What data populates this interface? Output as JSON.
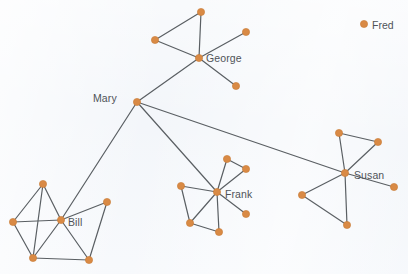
{
  "figure": {
    "type": "node-link-network-diagram",
    "background_color": "#f3f6fa",
    "node_color": "#d98a45",
    "node_stroke_color": "#c87a34",
    "edge_color": "#5a5f63",
    "label_color": "#4f5358",
    "node_radius": 3.6,
    "edge_width": 1.2,
    "width": 408,
    "height": 274
  },
  "chart_data": {
    "type": "network",
    "title": "",
    "node_count": 26,
    "edge_count": 33,
    "labeled_nodes": [
      "Mary",
      "George",
      "Bill",
      "Frank",
      "Susan",
      "Fred"
    ],
    "clusters": [
      {
        "name": "George",
        "hub": "george",
        "members": 4
      },
      {
        "name": "Bill",
        "hub": "bill",
        "members": 5
      },
      {
        "name": "Frank",
        "hub": "frank",
        "members": 6
      },
      {
        "name": "Susan",
        "hub": "susan",
        "members": 6
      },
      {
        "name": "Mary",
        "hub": "mary",
        "members": 1
      },
      {
        "name": "Fred",
        "hub": "fred",
        "members": 1
      }
    ],
    "nodes": [
      {
        "id": "mary",
        "x": 137,
        "y": 102,
        "label": "Mary",
        "label_dx": -30,
        "label_dy": -4,
        "labeled": true
      },
      {
        "id": "george",
        "x": 199,
        "y": 58,
        "label": "George",
        "label_dx": 7,
        "label_dy": 0,
        "labeled": true
      },
      {
        "id": "g1",
        "x": 201,
        "y": 12,
        "label": "",
        "labeled": false
      },
      {
        "id": "g2",
        "x": 155,
        "y": 40,
        "label": "",
        "labeled": false
      },
      {
        "id": "g3",
        "x": 246,
        "y": 32,
        "label": "",
        "labeled": false
      },
      {
        "id": "g4",
        "x": 236,
        "y": 86,
        "label": "",
        "labeled": false
      },
      {
        "id": "bill",
        "x": 61,
        "y": 220,
        "label": "Bill",
        "label_dx": 7,
        "label_dy": 2,
        "labeled": true
      },
      {
        "id": "b1",
        "x": 43,
        "y": 184,
        "label": "",
        "labeled": false
      },
      {
        "id": "b2",
        "x": 13,
        "y": 222,
        "label": "",
        "labeled": false
      },
      {
        "id": "b3",
        "x": 33,
        "y": 258,
        "label": "",
        "labeled": false
      },
      {
        "id": "b4",
        "x": 89,
        "y": 260,
        "label": "",
        "labeled": false
      },
      {
        "id": "b5",
        "x": 107,
        "y": 202,
        "label": "",
        "labeled": false
      },
      {
        "id": "frank",
        "x": 217,
        "y": 192,
        "label": "Frank",
        "label_dx": 8,
        "label_dy": 2,
        "labeled": true
      },
      {
        "id": "f1",
        "x": 227,
        "y": 159,
        "label": "",
        "labeled": false
      },
      {
        "id": "f2",
        "x": 246,
        "y": 169,
        "label": "",
        "labeled": false
      },
      {
        "id": "f3",
        "x": 181,
        "y": 186,
        "label": "",
        "labeled": false
      },
      {
        "id": "f4",
        "x": 190,
        "y": 223,
        "label": "",
        "labeled": false
      },
      {
        "id": "f5",
        "x": 219,
        "y": 232,
        "label": "",
        "labeled": false
      },
      {
        "id": "f6",
        "x": 246,
        "y": 214,
        "label": "",
        "labeled": false
      },
      {
        "id": "susan",
        "x": 345,
        "y": 173,
        "label": "Susan",
        "label_dx": 9,
        "label_dy": 2,
        "labeled": true
      },
      {
        "id": "s1",
        "x": 339,
        "y": 133,
        "label": "",
        "labeled": false
      },
      {
        "id": "s2",
        "x": 378,
        "y": 142,
        "label": "",
        "labeled": false
      },
      {
        "id": "s3",
        "x": 302,
        "y": 195,
        "label": "",
        "labeled": false
      },
      {
        "id": "s4",
        "x": 347,
        "y": 225,
        "label": "",
        "labeled": false
      },
      {
        "id": "s5",
        "x": 394,
        "y": 187,
        "label": "",
        "labeled": false
      },
      {
        "id": "fred",
        "x": 364,
        "y": 24,
        "label": "Fred",
        "label_dx": 8,
        "label_dy": 1,
        "labeled": true
      }
    ],
    "edges": [
      {
        "source": "mary",
        "target": "george"
      },
      {
        "source": "mary",
        "target": "bill"
      },
      {
        "source": "mary",
        "target": "frank"
      },
      {
        "source": "mary",
        "target": "susan"
      },
      {
        "source": "george",
        "target": "g1"
      },
      {
        "source": "george",
        "target": "g2"
      },
      {
        "source": "george",
        "target": "g3"
      },
      {
        "source": "george",
        "target": "g4"
      },
      {
        "source": "g1",
        "target": "g2"
      },
      {
        "source": "bill",
        "target": "b1"
      },
      {
        "source": "bill",
        "target": "b2"
      },
      {
        "source": "bill",
        "target": "b3"
      },
      {
        "source": "bill",
        "target": "b4"
      },
      {
        "source": "bill",
        "target": "b5"
      },
      {
        "source": "b1",
        "target": "b2"
      },
      {
        "source": "b1",
        "target": "b3"
      },
      {
        "source": "b2",
        "target": "b3"
      },
      {
        "source": "b3",
        "target": "b4"
      },
      {
        "source": "b4",
        "target": "b5"
      },
      {
        "source": "frank",
        "target": "f1"
      },
      {
        "source": "frank",
        "target": "f2"
      },
      {
        "source": "frank",
        "target": "f3"
      },
      {
        "source": "frank",
        "target": "f4"
      },
      {
        "source": "frank",
        "target": "f5"
      },
      {
        "source": "frank",
        "target": "f6"
      },
      {
        "source": "f1",
        "target": "f2"
      },
      {
        "source": "f3",
        "target": "f4"
      },
      {
        "source": "f4",
        "target": "f5"
      },
      {
        "source": "susan",
        "target": "s1"
      },
      {
        "source": "susan",
        "target": "s2"
      },
      {
        "source": "susan",
        "target": "s3"
      },
      {
        "source": "susan",
        "target": "s4"
      },
      {
        "source": "susan",
        "target": "s5"
      },
      {
        "source": "s1",
        "target": "s2"
      },
      {
        "source": "s3",
        "target": "s4"
      }
    ]
  }
}
